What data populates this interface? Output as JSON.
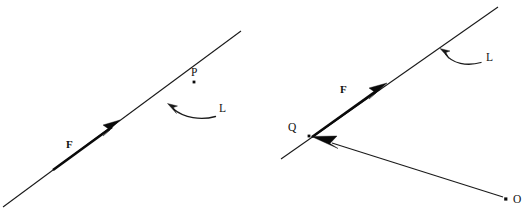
{
  "figure": {
    "background_color": "#ffffff",
    "ink_color": "#111111",
    "width": 525,
    "height": 212,
    "panels": [
      {
        "id": "panel-left",
        "name": "force-on-line-with-point-p",
        "labels": {
          "force": "F",
          "point_on_line": "P",
          "line_of_action": "L"
        },
        "geometry": {
          "line_start": [
            3,
            207
          ],
          "line_end": [
            241,
            31
          ],
          "force_shaft_start": [
            55,
            169
          ],
          "force_arrow_tip": [
            117,
            123
          ],
          "point_p_dot": [
            194,
            82
          ],
          "leader_curve_start": [
            217,
            117
          ],
          "leader_curve_end": [
            169,
            104
          ]
        }
      },
      {
        "id": "panel-right",
        "name": "force-on-line-with-position-vector",
        "labels": {
          "force": "F",
          "point_on_line": "Q",
          "line_of_action": "L",
          "origin": "O"
        },
        "geometry": {
          "line_start": [
            281,
            159
          ],
          "line_end": [
            498,
            7
          ],
          "force_shaft_start": [
            314,
            136
          ],
          "force_arrow_tip": [
            385,
            85
          ],
          "point_q_dot": [
            309,
            136
          ],
          "origin_dot": [
            506,
            199
          ],
          "position_vector_tail": [
            503,
            197
          ],
          "position_vector_tip": [
            312,
            137
          ],
          "leader_curve_start": [
            482,
            63
          ],
          "leader_curve_end": [
            441,
            49
          ]
        }
      }
    ]
  }
}
